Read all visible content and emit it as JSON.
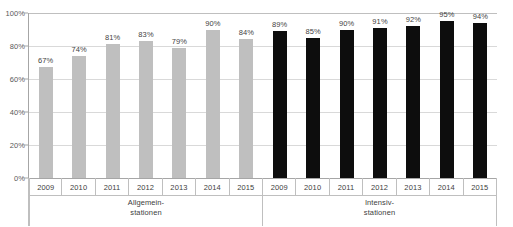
{
  "chart_data": {
    "type": "bar",
    "title": "",
    "subtitle": "",
    "xlabel": "",
    "ylabel": "",
    "ylim": [
      0,
      100
    ],
    "grid": true,
    "legend_position": "none",
    "value_suffix": "%",
    "categories": [
      "2009",
      "2010",
      "2011",
      "2012",
      "2013",
      "2014",
      "2015"
    ],
    "series": [
      {
        "name": "Allgemein-stationen",
        "color": "#BFBFBF",
        "group_label_lines": [
          "Allgemein-",
          "stationen"
        ],
        "categories": [
          "2009",
          "2010",
          "2011",
          "2012",
          "2013",
          "2014",
          "2015"
        ],
        "values": [
          67,
          74,
          81,
          83,
          79,
          90,
          84
        ],
        "data_labels": [
          "67%",
          "74%",
          "81%",
          "83%",
          "79%",
          "90%",
          "84%"
        ]
      },
      {
        "name": "Intensiv-stationen",
        "color": "#0D0D0D",
        "group_label_lines": [
          "Intensiv-",
          "stationen"
        ],
        "categories": [
          "2009",
          "2010",
          "2011",
          "2012",
          "2013",
          "2014",
          "2015"
        ],
        "values": [
          89,
          85,
          90,
          91,
          92,
          95,
          94
        ],
        "data_labels": [
          "89%",
          "85%",
          "90%",
          "91%",
          "92%",
          "95%",
          "94%"
        ]
      }
    ],
    "y_ticks": [
      {
        "value": 0,
        "label": "0%"
      },
      {
        "value": 20,
        "label": "20%"
      },
      {
        "value": 40,
        "label": "40%"
      },
      {
        "value": 60,
        "label": "60%"
      },
      {
        "value": 80,
        "label": "80%"
      },
      {
        "value": 100,
        "label": "100%"
      }
    ]
  },
  "colors": {
    "series_general": "#BFBFBF",
    "series_icu": "#0D0D0D",
    "gridline": "#D9D9D9",
    "axis": "#A6A6A6",
    "text": "#404040",
    "background": "#FFFFFF"
  }
}
